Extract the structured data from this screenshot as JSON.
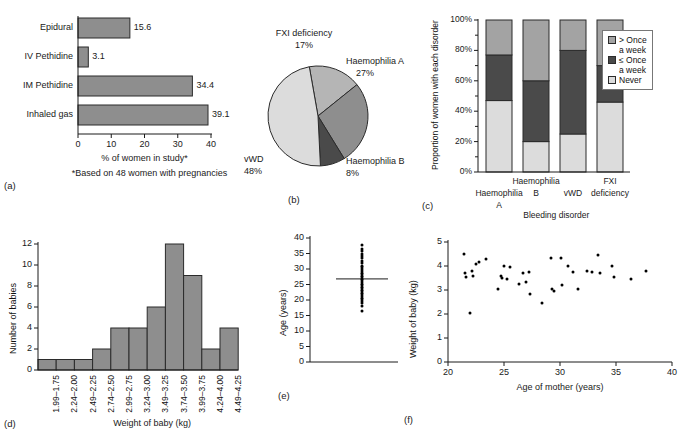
{
  "figure": {
    "panels": [
      "(a)",
      "(b)",
      "(c)",
      "(d)",
      "(e)",
      "(f)"
    ]
  },
  "chart_data": [
    {
      "panel": "a",
      "type": "bar",
      "orientation": "horizontal",
      "categories": [
        "Epidural",
        "IV Pethidine",
        "IM Pethidine",
        "Inhaled gas"
      ],
      "values": [
        15.6,
        3.1,
        34.4,
        39.1
      ],
      "value_labels": [
        "15.6",
        "3.1",
        "34.4",
        "39.1"
      ],
      "xlabel": "% of women in study*",
      "ylabel": "",
      "xlim": [
        0,
        40
      ],
      "xticks": [
        0,
        10,
        20,
        30,
        40
      ],
      "xtick_labels": [
        "0",
        "10",
        "20",
        "30",
        "40"
      ],
      "footnote": "*Based on 48 women with pregnancies",
      "grid": false,
      "bar_color": "#8e8e8e"
    },
    {
      "panel": "b",
      "type": "pie",
      "labels": [
        "FXI deficiency",
        "Haemophilia A",
        "Haemophilia B",
        "vWD"
      ],
      "values": [
        17,
        27,
        8,
        48
      ],
      "value_labels": [
        "17%",
        "27%",
        "8%",
        "48%"
      ],
      "colors": [
        "#b5b5b5",
        "#8e8e8e",
        "#4a4a4a",
        "#dcdcdc"
      ],
      "title": "",
      "legend_position": "outside-callouts"
    },
    {
      "panel": "c",
      "type": "bar",
      "stacked": true,
      "categories": [
        "Haemophilia A",
        "Haemophilia B",
        "vWD",
        "FXI deficiency"
      ],
      "category_lines": [
        [
          "Haemophilia",
          "A"
        ],
        [
          "Haemophilia",
          "B"
        ],
        [
          "vWD"
        ],
        [
          "FXI",
          "deficiency"
        ]
      ],
      "series": [
        {
          "name": "Never",
          "values": [
            47,
            20,
            25,
            46
          ],
          "color": "#dcdcdc"
        },
        {
          "name": "≤ Once a week",
          "values": [
            30,
            40,
            55,
            24
          ],
          "color": "#4a4a4a"
        },
        {
          "name": "> Once a week",
          "values": [
            23,
            40,
            20,
            30
          ],
          "color": "#a3a3a3"
        }
      ],
      "legend_entries": [
        {
          "label_line1": "> Once",
          "label_line2": "a week",
          "color": "#a3a3a3"
        },
        {
          "label_line1": "≤ Once",
          "label_line2": "a week",
          "color": "#4a4a4a"
        },
        {
          "label_line1": "Never",
          "label_line2": "",
          "color": "#dcdcdc"
        }
      ],
      "xlabel": "Bleeding disorder",
      "ylabel": "Proportion of women with each disorder",
      "ylim": [
        0,
        100
      ],
      "yticks": [
        0,
        20,
        40,
        60,
        80,
        100
      ],
      "ytick_labels": [
        "0%",
        "20%",
        "40%",
        "60%",
        "80%",
        "100%"
      ],
      "minor_tick_step": 10,
      "grid": false
    },
    {
      "panel": "d",
      "type": "bar",
      "categories": [
        "1.75–1.99",
        "2.00–2.24",
        "2.25–2.49",
        "2.50–2.74",
        "2.75–2.99",
        "3.00–3.24",
        "3.25–3.49",
        "3.50–3.74",
        "3.75–3.99",
        "4.00–4.24",
        "4.25–4.49"
      ],
      "values": [
        1,
        1,
        1,
        2,
        4,
        4,
        6,
        12,
        9,
        2,
        4
      ],
      "xlabel": "Weight of baby (kg)",
      "ylabel": "Number of babies",
      "ylim": [
        0,
        12
      ],
      "yticks": [
        0,
        2,
        4,
        6,
        8,
        10,
        12
      ],
      "ytick_labels": [
        "0",
        "2",
        "4",
        "6",
        "8",
        "10",
        "12"
      ],
      "grid": false,
      "bar_color": "#8e8e8e"
    },
    {
      "panel": "e",
      "type": "scatter",
      "variant": "dot-column-with-mean",
      "ylabel": "Age (years)",
      "xlabel": "",
      "ylim": [
        0,
        40
      ],
      "yticks": [
        0,
        5,
        10,
        15,
        20,
        25,
        30,
        35,
        40
      ],
      "ytick_labels": [
        "0",
        "5",
        "10",
        "15",
        "20",
        "25",
        "30",
        "35",
        "40"
      ],
      "mean_line": 26.8,
      "values": [
        16.3,
        18.2,
        19.0,
        19.6,
        20.2,
        20.8,
        21.3,
        21.8,
        22.3,
        22.8,
        23.3,
        23.8,
        24.3,
        24.8,
        25.3,
        25.8,
        26.3,
        26.8,
        27.3,
        27.8,
        28.3,
        28.8,
        29.3,
        29.9,
        30.5,
        31.1,
        31.8,
        32.6,
        33.4,
        34.2,
        35.0,
        35.8,
        36.6,
        37.6
      ],
      "grid": false
    },
    {
      "panel": "f",
      "type": "scatter",
      "xlabel": "Age of mother (years)",
      "ylabel": "Weight of baby (kg)",
      "xlim": [
        20,
        40
      ],
      "ylim": [
        0,
        5
      ],
      "xticks": [
        20,
        25,
        30,
        35,
        40
      ],
      "xtick_labels": [
        "20",
        "25",
        "30",
        "35",
        "40"
      ],
      "yticks": [
        0,
        1,
        2,
        3,
        4,
        5
      ],
      "ytick_labels": [
        "0",
        "1",
        "2",
        "3",
        "4",
        "5"
      ],
      "grid": false,
      "points": [
        [
          21.4,
          4.5
        ],
        [
          21.5,
          3.7
        ],
        [
          21.6,
          3.55
        ],
        [
          22.0,
          2.05
        ],
        [
          22.1,
          3.8
        ],
        [
          22.2,
          3.6
        ],
        [
          22.5,
          4.1
        ],
        [
          22.8,
          4.15
        ],
        [
          23.4,
          4.3
        ],
        [
          24.5,
          3.05
        ],
        [
          24.7,
          3.6
        ],
        [
          24.8,
          3.5
        ],
        [
          25.0,
          4.0
        ],
        [
          25.3,
          3.45
        ],
        [
          25.5,
          3.95
        ],
        [
          26.3,
          3.25
        ],
        [
          26.7,
          3.7
        ],
        [
          27.0,
          3.35
        ],
        [
          27.2,
          3.75
        ],
        [
          27.3,
          2.85
        ],
        [
          28.4,
          2.45
        ],
        [
          29.2,
          4.35
        ],
        [
          29.3,
          3.05
        ],
        [
          29.5,
          2.95
        ],
        [
          30.1,
          4.35
        ],
        [
          30.2,
          3.2
        ],
        [
          30.7,
          4.0
        ],
        [
          31.2,
          3.75
        ],
        [
          31.6,
          3.05
        ],
        [
          32.4,
          3.8
        ],
        [
          32.9,
          3.75
        ],
        [
          33.4,
          4.45
        ],
        [
          33.6,
          3.7
        ],
        [
          34.6,
          4.0
        ],
        [
          34.8,
          3.55
        ],
        [
          36.3,
          3.45
        ],
        [
          37.7,
          3.8
        ]
      ]
    }
  ]
}
